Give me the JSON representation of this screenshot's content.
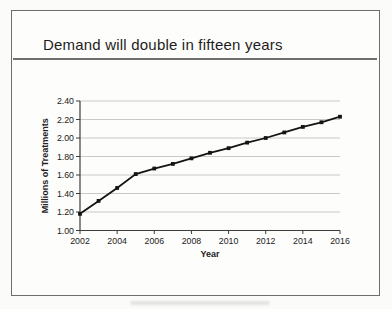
{
  "slide": {
    "title": "Demand will double in fifteen years"
  },
  "chart_data": {
    "type": "line",
    "title": "Demand will double in fifteen years",
    "xlabel": "Year",
    "ylabel": "Millions of Treatments",
    "x": [
      2002,
      2003,
      2004,
      2005,
      2006,
      2007,
      2008,
      2009,
      2010,
      2011,
      2012,
      2013,
      2014,
      2015,
      2016
    ],
    "values": [
      1.18,
      1.32,
      1.46,
      1.61,
      1.67,
      1.72,
      1.78,
      1.84,
      1.89,
      1.95,
      2.0,
      2.06,
      2.12,
      2.17,
      2.23
    ],
    "x_ticks": [
      2002,
      2004,
      2006,
      2008,
      2010,
      2012,
      2014,
      2016
    ],
    "y_ticks": [
      1.0,
      1.2,
      1.4,
      1.6,
      1.8,
      2.0,
      2.2,
      2.4
    ],
    "xlim": [
      2002,
      2016
    ],
    "ylim": [
      1.0,
      2.4
    ],
    "grid": "horizontal",
    "legend": "none",
    "marker": "square",
    "line_color": "#141414",
    "gridline_color": "#c9c9c9",
    "axis_color": "#3d3d3d",
    "text_color": "#222222"
  }
}
